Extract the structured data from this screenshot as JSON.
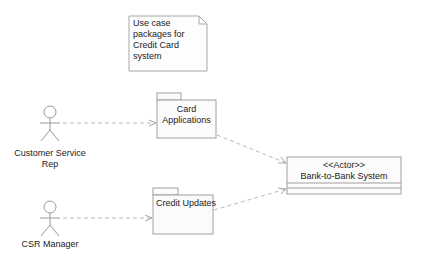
{
  "diagram": {
    "type": "UML use case package diagram",
    "note": {
      "lines": [
        "Use case",
        "packages for",
        "Credit Card",
        "system"
      ]
    },
    "actors": [
      {
        "id": "csr",
        "label_lines": [
          "Customer Service",
          "Rep"
        ]
      },
      {
        "id": "csr_manager",
        "label_lines": [
          "CSR Manager"
        ]
      }
    ],
    "packages": [
      {
        "id": "card_apps",
        "label_lines": [
          "Card",
          "Applications"
        ]
      },
      {
        "id": "credit_updates",
        "label_lines": [
          "Credit Updates"
        ]
      }
    ],
    "external_system": {
      "stereotype": "<<Actor>>",
      "name": "Bank-to-Bank System"
    },
    "dependencies": [
      {
        "from": "Customer Service Rep",
        "to": "Card Applications"
      },
      {
        "from": "CSR Manager",
        "to": "Credit Updates"
      },
      {
        "from": "Card Applications",
        "to": "Bank-to-Bank System"
      },
      {
        "from": "Credit Updates",
        "to": "Bank-to-Bank System"
      }
    ],
    "colors": {
      "line": "#9a9a9a",
      "dashed": "#b8b8b8",
      "fill": "#fbfbfb",
      "text": "#222222"
    }
  }
}
